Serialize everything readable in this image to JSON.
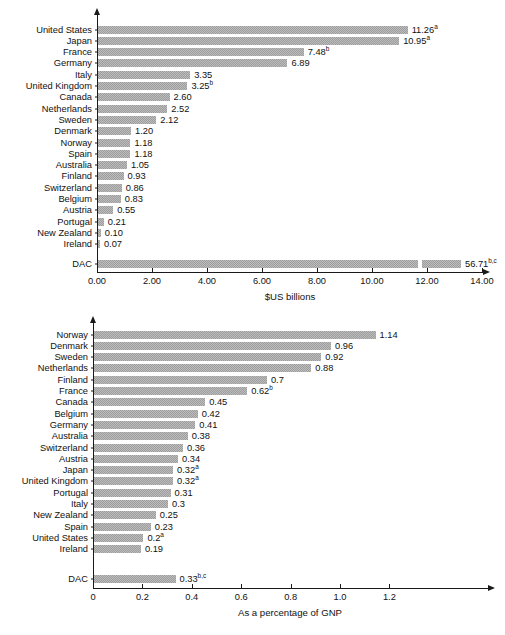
{
  "chart_data": [
    {
      "id": "oda-volume",
      "type": "bar",
      "orientation": "horizontal",
      "title": "",
      "xlabel": "$US billions",
      "ylabel": "",
      "xlim": [
        0,
        14
      ],
      "xticks": [
        "0.00",
        "2.00",
        "4.00",
        "6.00",
        "8.00",
        "10.00",
        "12.00",
        "14.00"
      ],
      "xtick_values": [
        0,
        2,
        4,
        6,
        8,
        10,
        12,
        14
      ],
      "grid": false,
      "legend": "none",
      "categories": [
        "United States",
        "Japan",
        "France",
        "Germany",
        "Italy",
        "United Kingdom",
        "Canada",
        "Netherlands",
        "Sweden",
        "Denmark",
        "Norway",
        "Spain",
        "Australia",
        "Finland",
        "Switzerland",
        "Belgium",
        "Austria",
        "Portugal",
        "New Zealand",
        "Ireland"
      ],
      "values": [
        11.26,
        10.95,
        7.48,
        6.89,
        3.35,
        3.25,
        2.6,
        2.52,
        2.12,
        1.2,
        1.18,
        1.18,
        1.05,
        0.93,
        0.86,
        0.83,
        0.55,
        0.21,
        0.1,
        0.07
      ],
      "value_labels": [
        "11.26",
        "10.95",
        "7.48",
        "6.89",
        "3.35",
        "3.25",
        "2.60",
        "2.52",
        "2.12",
        "1.20",
        "1.18",
        "1.18",
        "1.05",
        "0.93",
        "0.86",
        "0.83",
        "0.55",
        "0.21",
        "0.10",
        "0.07"
      ],
      "value_notes": [
        "a",
        "a",
        "b",
        "",
        "",
        "b",
        "",
        "",
        "",
        "",
        "",
        "",
        "",
        "",
        "",
        "",
        "",
        "",
        "",
        ""
      ],
      "total_row": {
        "category": "DAC",
        "value": 56.71,
        "value_label": "56.71",
        "value_note": "b,c",
        "drawn_length": 13.2,
        "axis_break_at": 11.65,
        "note": "bar truncated with break; true value exceeds axis maximum"
      }
    },
    {
      "id": "oda-percent-gnp",
      "type": "bar",
      "orientation": "horizontal",
      "title": "",
      "xlabel": "As a percentage of GNP",
      "ylabel": "",
      "xlim": [
        0,
        1.4
      ],
      "xticks": [
        "0",
        "0.2",
        "0.4",
        "0.6",
        "0.8",
        "1.0",
        "1.2"
      ],
      "xtick_values": [
        0,
        0.2,
        0.4,
        0.6,
        0.8,
        1.0,
        1.2
      ],
      "grid": false,
      "legend": "none",
      "categories": [
        "Norway",
        "Denmark",
        "Sweden",
        "Netherlands",
        "Finland",
        "France",
        "Canada",
        "Belgium",
        "Germany",
        "Australia",
        "Switzerland",
        "Austria",
        "Japan",
        "United Kingdom",
        "Portugal",
        "Italy",
        "New Zealand",
        "Spain",
        "United States",
        "Ireland"
      ],
      "values": [
        1.14,
        0.96,
        0.92,
        0.88,
        0.7,
        0.62,
        0.45,
        0.42,
        0.41,
        0.38,
        0.36,
        0.34,
        0.32,
        0.32,
        0.31,
        0.3,
        0.25,
        0.23,
        0.2,
        0.19
      ],
      "value_labels": [
        "1.14",
        "0.96",
        "0.92",
        "0.88",
        "0.7",
        "0.62",
        "0.45",
        "0.42",
        "0.41",
        "0.38",
        "0.36",
        "0.34",
        "0.32",
        "0.32",
        "0.31",
        "0.3",
        "0.25",
        "0.23",
        "0.2",
        "0.19"
      ],
      "value_notes": [
        "",
        "",
        "",
        "",
        "",
        "b",
        "",
        "",
        "",
        "",
        "",
        "",
        "a",
        "a",
        "",
        "",
        "",
        "",
        "a",
        ""
      ],
      "total_row": {
        "category": "DAC",
        "value": 0.33,
        "value_label": "0.33",
        "value_note": "b,c",
        "drawn_length": 0.33,
        "axis_break_at": null,
        "note": ""
      }
    }
  ],
  "style": {
    "bar_fill": "#9d9d9d",
    "bar_hatch": "#bdbdbd",
    "axis_color": "#1a1a1a",
    "text_color": "#111111",
    "background": "#ffffff"
  }
}
